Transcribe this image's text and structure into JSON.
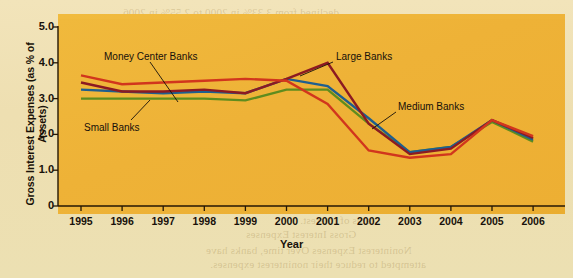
{
  "figure": {
    "background_color": "#efe1b4",
    "panel_color": "#eeb237",
    "ylabel": "Gross Interest Expenses (as % of Assets)",
    "xlabel": "Year"
  },
  "annotations": [
    {
      "text": "Money Center Banks",
      "x": 104,
      "y": 51,
      "leader": [
        150,
        62,
        178,
        102
      ]
    },
    {
      "text": "Small Banks",
      "x": 84,
      "y": 122,
      "leader": [
        131,
        120,
        150,
        100
      ]
    },
    {
      "text": "Large Banks",
      "x": 336,
      "y": 51,
      "leader": [
        333,
        62,
        300,
        76
      ]
    },
    {
      "text": "Medium Banks",
      "x": 398,
      "y": 101,
      "leader": [
        396,
        112,
        372,
        129
      ]
    }
  ],
  "bleed_text": [
    {
      "text": "declined from 3.33% in 2000 to 2.55% in 2006.",
      "x": 120,
      "y": 6
    },
    {
      "text": "Gross Interest Expenses",
      "x": 300,
      "y": 18
    },
    {
      "text": "banks experienced a general decline in their gross",
      "x": 210,
      "y": 32
    },
    {
      "text": "interest expenses as a percentage of assets over",
      "x": 215,
      "y": 46
    },
    {
      "text": "time, as shown in Exhibit 17.6. In particular, gross",
      "x": 212,
      "y": 60
    },
    {
      "text": "interest expenses declined substantially after",
      "x": 220,
      "y": 74
    },
    {
      "text": "2000, which reflects the decline in interest rates.",
      "x": 214,
      "y": 88
    },
    {
      "text": "Banks could then obtain deposits at a relatively",
      "x": 216,
      "y": 102
    },
    {
      "text": "low cost, which reduced their interest expenses.",
      "x": 214,
      "y": 116
    },
    {
      "text": "Thus the money center banks tend to incur",
      "x": 226,
      "y": 130
    },
    {
      "text": "higher interest expenses because they rely more",
      "x": 212,
      "y": 144
    },
    {
      "text": "heavily on borrowed funds than the other banks.",
      "x": 210,
      "y": 158
    },
    {
      "text": "The gross interest expenses of small banks were",
      "x": 212,
      "y": 172
    },
    {
      "text": "relatively low, because they tend to obtain more",
      "x": 214,
      "y": 186
    },
    {
      "text": "deposits from local depositors, which pay lower",
      "x": 214,
      "y": 200
    },
    {
      "text": "rates of interest.",
      "x": 300,
      "y": 214
    },
    {
      "text": "Gross Interest Expenses",
      "x": 246,
      "y": 228
    },
    {
      "text": "Noninterest Expenses  Over time, banks have",
      "x": 206,
      "y": 244
    },
    {
      "text": "attempted to reduce their noninterest expenses.",
      "x": 210,
      "y": 258
    }
  ],
  "chart_data": {
    "type": "line",
    "title": "",
    "xlabel": "Year",
    "ylabel": "Gross Interest Expenses (as % of Assets)",
    "x": [
      1995,
      1996,
      1997,
      1998,
      1999,
      2000,
      2001,
      2002,
      2003,
      2004,
      2005,
      2006
    ],
    "xlim": [
      1994.5,
      2006.5
    ],
    "ylim": [
      0,
      5.0
    ],
    "yticks": [
      0,
      1.0,
      2.0,
      3.0,
      4.0,
      5.0
    ],
    "ytick_labels": [
      "0",
      "1.0",
      "2.0",
      "3.0",
      "4.0",
      "5.0"
    ],
    "xtick_labels": [
      "1995",
      "1996",
      "1997",
      "1998",
      "1999",
      "2000",
      "2001",
      "2002",
      "2003",
      "2004",
      "2005",
      "2006"
    ],
    "grid": false,
    "legend": "annotated-inline",
    "series": [
      {
        "name": "Money Center Banks",
        "color": "#d1361d",
        "values": [
          3.65,
          3.4,
          3.45,
          3.5,
          3.55,
          3.5,
          2.85,
          1.55,
          1.35,
          1.45,
          2.4,
          1.95
        ]
      },
      {
        "name": "Large Banks",
        "color": "#8c1a22",
        "values": [
          3.45,
          3.2,
          3.2,
          3.25,
          3.15,
          3.55,
          4.0,
          2.3,
          1.45,
          1.6,
          2.4,
          1.9
        ]
      },
      {
        "name": "Medium Banks",
        "color": "#1e5f8f",
        "values": [
          3.25,
          3.2,
          3.15,
          3.2,
          3.15,
          3.55,
          3.35,
          2.45,
          1.5,
          1.65,
          2.4,
          1.85
        ]
      },
      {
        "name": "Small Banks",
        "color": "#5f8c1e",
        "values": [
          3.0,
          3.0,
          3.0,
          3.0,
          2.95,
          3.25,
          3.25,
          2.3,
          1.5,
          1.65,
          2.35,
          1.8
        ]
      }
    ]
  }
}
